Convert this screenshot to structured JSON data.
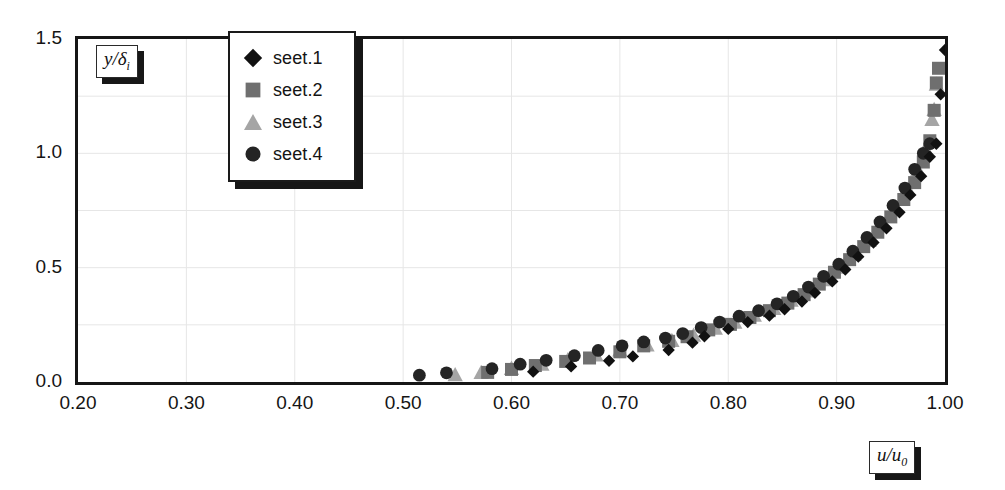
{
  "chart_data": {
    "type": "scatter",
    "title": "",
    "xlabel": "u/u_0",
    "ylabel": "y/delta_i",
    "xlim": [
      0.2,
      1.0
    ],
    "ylim": [
      0.0,
      1.5
    ],
    "xticks": [
      "0.20",
      "0.30",
      "0.40",
      "0.50",
      "0.60",
      "0.70",
      "0.80",
      "0.90",
      "1.00"
    ],
    "xtick_values": [
      0.2,
      0.3,
      0.4,
      0.5,
      0.6,
      0.7,
      0.8,
      0.9,
      1.0
    ],
    "yticks": [
      "0.0",
      "0.5",
      "1.0",
      "1.5"
    ],
    "ytick_values": [
      0.0,
      0.5,
      1.0,
      1.5
    ],
    "grid": true,
    "grid_x_step": 0.1,
    "grid_y_step": 0.25,
    "legend_position": "top-center",
    "series": [
      {
        "name": "seet.1",
        "marker": "diamond",
        "color": "#111111",
        "points": [
          [
            0.62,
            0.045
          ],
          [
            0.655,
            0.068
          ],
          [
            0.69,
            0.093
          ],
          [
            0.712,
            0.112
          ],
          [
            0.745,
            0.14
          ],
          [
            0.767,
            0.172
          ],
          [
            0.778,
            0.2
          ],
          [
            0.8,
            0.232
          ],
          [
            0.818,
            0.262
          ],
          [
            0.838,
            0.29
          ],
          [
            0.852,
            0.318
          ],
          [
            0.868,
            0.352
          ],
          [
            0.88,
            0.39
          ],
          [
            0.896,
            0.44
          ],
          [
            0.908,
            0.492
          ],
          [
            0.92,
            0.548
          ],
          [
            0.934,
            0.61
          ],
          [
            0.946,
            0.672
          ],
          [
            0.958,
            0.742
          ],
          [
            0.968,
            0.818
          ],
          [
            0.978,
            0.9
          ],
          [
            0.986,
            0.985
          ],
          [
            0.992,
            1.042
          ],
          [
            0.996,
            1.258
          ],
          [
            1.0,
            1.452
          ]
        ]
      },
      {
        "name": "seet.2",
        "marker": "square",
        "color": "#6f6f6f",
        "points": [
          [
            0.578,
            0.042
          ],
          [
            0.6,
            0.055
          ],
          [
            0.622,
            0.072
          ],
          [
            0.65,
            0.09
          ],
          [
            0.672,
            0.105
          ],
          [
            0.7,
            0.132
          ],
          [
            0.722,
            0.158
          ],
          [
            0.745,
            0.178
          ],
          [
            0.762,
            0.198
          ],
          [
            0.782,
            0.228
          ],
          [
            0.802,
            0.252
          ],
          [
            0.82,
            0.282
          ],
          [
            0.838,
            0.312
          ],
          [
            0.855,
            0.345
          ],
          [
            0.87,
            0.382
          ],
          [
            0.884,
            0.428
          ],
          [
            0.898,
            0.48
          ],
          [
            0.912,
            0.535
          ],
          [
            0.925,
            0.592
          ],
          [
            0.938,
            0.655
          ],
          [
            0.95,
            0.722
          ],
          [
            0.962,
            0.798
          ],
          [
            0.972,
            0.872
          ],
          [
            0.98,
            0.962
          ],
          [
            0.986,
            1.055
          ],
          [
            0.99,
            1.188
          ],
          [
            0.992,
            1.308
          ],
          [
            0.994,
            1.372
          ]
        ]
      },
      {
        "name": "seet.3",
        "marker": "triangle",
        "color": "#a5a5a5",
        "points": [
          [
            0.548,
            0.032
          ],
          [
            0.572,
            0.042
          ],
          [
            0.6,
            0.06
          ],
          [
            0.628,
            0.078
          ],
          [
            0.652,
            0.098
          ],
          [
            0.678,
            0.118
          ],
          [
            0.7,
            0.14
          ],
          [
            0.725,
            0.162
          ],
          [
            0.748,
            0.182
          ],
          [
            0.768,
            0.205
          ],
          [
            0.788,
            0.235
          ],
          [
            0.806,
            0.262
          ],
          [
            0.824,
            0.292
          ],
          [
            0.842,
            0.322
          ],
          [
            0.858,
            0.358
          ],
          [
            0.872,
            0.398
          ],
          [
            0.888,
            0.448
          ],
          [
            0.902,
            0.502
          ],
          [
            0.916,
            0.558
          ],
          [
            0.93,
            0.62
          ],
          [
            0.942,
            0.688
          ],
          [
            0.955,
            0.762
          ],
          [
            0.966,
            0.842
          ],
          [
            0.975,
            0.93
          ],
          [
            0.982,
            1.022
          ],
          [
            0.988,
            1.148
          ],
          [
            0.99,
            1.192
          ],
          [
            0.992,
            1.302
          ]
        ]
      },
      {
        "name": "seet.4",
        "marker": "circle",
        "color": "#242424",
        "points": [
          [
            0.515,
            0.03
          ],
          [
            0.54,
            0.04
          ],
          [
            0.582,
            0.058
          ],
          [
            0.608,
            0.078
          ],
          [
            0.632,
            0.095
          ],
          [
            0.658,
            0.115
          ],
          [
            0.68,
            0.138
          ],
          [
            0.702,
            0.158
          ],
          [
            0.722,
            0.175
          ],
          [
            0.742,
            0.192
          ],
          [
            0.758,
            0.212
          ],
          [
            0.775,
            0.238
          ],
          [
            0.792,
            0.262
          ],
          [
            0.81,
            0.288
          ],
          [
            0.828,
            0.312
          ],
          [
            0.845,
            0.342
          ],
          [
            0.86,
            0.375
          ],
          [
            0.874,
            0.415
          ],
          [
            0.888,
            0.462
          ],
          [
            0.902,
            0.515
          ],
          [
            0.915,
            0.572
          ],
          [
            0.928,
            0.632
          ],
          [
            0.94,
            0.7
          ],
          [
            0.952,
            0.772
          ],
          [
            0.963,
            0.848
          ],
          [
            0.972,
            0.93
          ],
          [
            0.98,
            1.0
          ],
          [
            0.986,
            1.042
          ]
        ]
      }
    ]
  },
  "legend": {
    "items": [
      {
        "label": "seet.1",
        "marker": "diamond"
      },
      {
        "label": "seet.2",
        "marker": "square"
      },
      {
        "label": "seet.3",
        "marker": "triangle"
      },
      {
        "label": "seet.4",
        "marker": "circle"
      }
    ]
  },
  "axis_titles": {
    "y": "y/δ",
    "y_sub": "i",
    "x": "u/u",
    "x_sub": "0"
  },
  "colors": {
    "frame": "#161616",
    "grid": "#e6e6e6",
    "text": "#151515",
    "series1": "#111111",
    "series2": "#6f6f6f",
    "series3": "#a5a5a5",
    "series4": "#242424"
  }
}
